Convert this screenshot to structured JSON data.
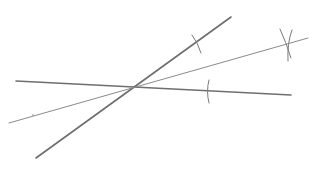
{
  "diagram": {
    "type": "geometric-construction",
    "background": "#ffffff",
    "colors": {
      "ray": "#6e6e6e",
      "bisector": "#8a8a8a",
      "arc": "#7a7a7a"
    },
    "lines": [
      {
        "id": "ray-a",
        "x1": 16,
        "y1": 81,
        "x2": 291,
        "y2": 95,
        "width": 1.6
      },
      {
        "id": "ray-b",
        "x1": 36,
        "y1": 158,
        "x2": 231,
        "y2": 17,
        "width": 1.6
      },
      {
        "id": "bisector",
        "x1": 9,
        "y1": 123,
        "x2": 308,
        "y2": 38,
        "width": 1.0
      }
    ],
    "vertex": {
      "x": 134,
      "y": 87
    },
    "arcs": [
      {
        "id": "arc-on-ray-b",
        "d": "M 192 35 Q 198 43 201 53"
      },
      {
        "id": "arc-on-ray-a",
        "d": "M 209 80 Q 206 91 209 103"
      },
      {
        "id": "arc-intersect-1",
        "d": "M 280 29 Q 286 42 291 58"
      },
      {
        "id": "arc-intersect-2",
        "d": "M 292 30 Q 287 43 288 61"
      }
    ],
    "marks": [
      {
        "id": "small-mark",
        "x": 33,
        "y": 115
      }
    ]
  }
}
